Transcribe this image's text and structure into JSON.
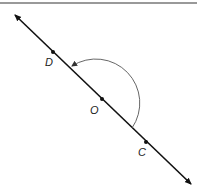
{
  "diagram": {
    "type": "geometry-line-with-angle",
    "line": {
      "name": "line CD",
      "arrows": "both-ends"
    },
    "points": [
      {
        "id": "D",
        "label": "D"
      },
      {
        "id": "O",
        "label": "O"
      },
      {
        "id": "C",
        "label": "C"
      }
    ],
    "angle_arc": {
      "vertex": "O",
      "from": "C",
      "to": "D",
      "measure_deg": 180,
      "direction": "counterclockwise"
    },
    "colors": {
      "line": "#111111",
      "arc": "#555555",
      "border": "#777777"
    }
  }
}
